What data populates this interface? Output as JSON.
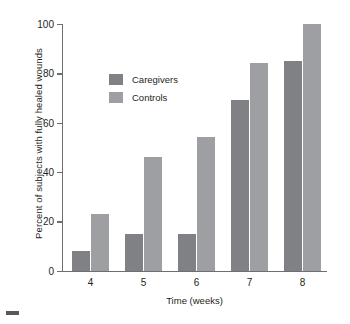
{
  "chart_data": {
    "type": "bar",
    "title": "",
    "xlabel": "Time (weeks)",
    "ylabel": "Percent of subjects with fully healed wounds",
    "categories": [
      "4",
      "5",
      "6",
      "7",
      "8"
    ],
    "series": [
      {
        "name": "Caregivers",
        "color": "#808184",
        "values": [
          8,
          15,
          15,
          69,
          85
        ]
      },
      {
        "name": "Controls",
        "color": "#9d9fa2",
        "values": [
          23,
          46,
          54,
          84,
          100
        ]
      }
    ],
    "ylim": [
      0,
      100
    ],
    "yticks": [
      0,
      20,
      40,
      60,
      80,
      100
    ],
    "ytick_labels": [
      "0",
      "20",
      "40",
      "60",
      "80",
      "100"
    ],
    "grid": false,
    "legend_position": "upper-left-inside"
  },
  "legend": {
    "items": [
      {
        "label": "Caregivers"
      },
      {
        "label": "Controls"
      }
    ]
  },
  "marks": {
    "corner": ""
  }
}
